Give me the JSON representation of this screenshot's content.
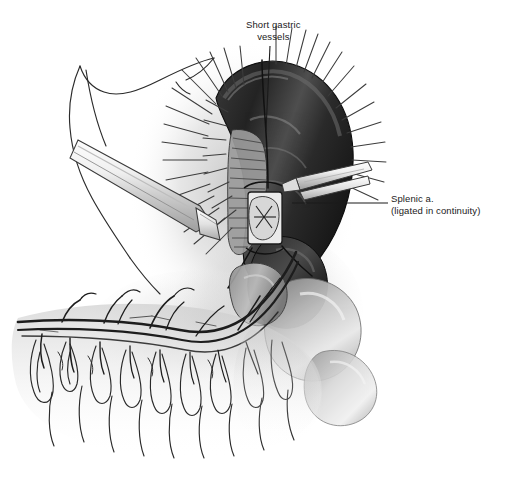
{
  "figure": {
    "name": "splenic-mobilization-illustration",
    "style": "grayscale-pen-and-ink-medical-illustration",
    "background_color": "#ffffff",
    "ink_color": "#1a1a1a",
    "width": 513,
    "height": 488
  },
  "labels": {
    "short_gastric": {
      "line1": "Short gastric",
      "line2": "vessels"
    },
    "splenic_artery": {
      "line1": "Splenic a.",
      "line2": "(ligated in continuity)"
    }
  },
  "structures": {
    "spleen": "spleen-shape",
    "stomach": "stomach-outline-shape",
    "pancreas_tail": "pancreas-tail-shape",
    "omentum": "greater-omentum-shape",
    "gastroepiploic_arcade": "gastroepiploic-vessel-arcade",
    "retractor": "surgical-retractor-blade",
    "forceps": "surgical-forceps",
    "ligature_sutures": "radiating-ligature-sutures",
    "cut_vessel_stump": "cut-vessel-cross-section"
  }
}
